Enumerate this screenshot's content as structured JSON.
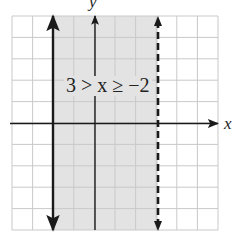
{
  "graph": {
    "x_axis_label": "x",
    "y_axis_label": "y",
    "inequality_label": "3 > x ≥ −2",
    "grid": {
      "x_min": -4,
      "x_max": 6,
      "y_min": -5,
      "y_max": 5,
      "step": 1
    },
    "boundaries": [
      {
        "x": -2,
        "style": "solid",
        "inclusive": true
      },
      {
        "x": 3,
        "style": "dashed",
        "inclusive": false
      }
    ],
    "shaded_region": {
      "from_x": -2,
      "to_x": 3
    },
    "colors": {
      "shade": "#e3e3e3",
      "grid": "#c9c9c9",
      "line": "#1a1a1a"
    }
  }
}
